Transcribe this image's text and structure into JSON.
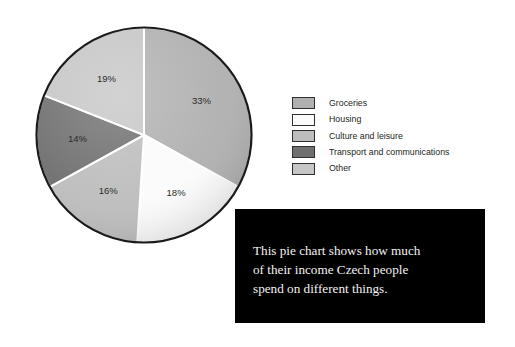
{
  "chart_data": {
    "type": "pie",
    "title": "",
    "categories": [
      "Groceries",
      "Housing",
      "Culture and leisure",
      "Transport and communications",
      "Other"
    ],
    "values": [
      33,
      18,
      16,
      14,
      19
    ],
    "value_labels": [
      "33%",
      "18%",
      "16%",
      "14%",
      "19%"
    ],
    "unit": "%",
    "colors": [
      "#b0b0b0",
      "#fbfbfb",
      "#bdbdbd",
      "#6f6f6f",
      "#c6c6c6"
    ],
    "start_angle_deg": 0,
    "direction": "clockwise",
    "legend_position": "right",
    "grid": false,
    "slices": [
      {
        "label": "Groceries",
        "value": 33,
        "value_label": "33%",
        "color": "#b0b0b0"
      },
      {
        "label": "Housing",
        "value": 18,
        "value_label": "18%",
        "color": "#fbfbfb"
      },
      {
        "label": "Culture and leisure",
        "value": 16,
        "value_label": "16%",
        "color": "#bdbdbd"
      },
      {
        "label": "Transport and communications",
        "value": 14,
        "value_label": "14%",
        "color": "#6f6f6f"
      },
      {
        "label": "Other",
        "value": 19,
        "value_label": "19%",
        "color": "#c6c6c6"
      }
    ]
  },
  "legend": {
    "items": [
      {
        "label": "Groceries",
        "color": "#b0b0b0"
      },
      {
        "label": "Housing",
        "color": "#fbfbfb"
      },
      {
        "label": "Culture and leisure",
        "color": "#bdbdbd"
      },
      {
        "label": "Transport and communications",
        "color": "#6f6f6f"
      },
      {
        "label": "Other",
        "color": "#c6c6c6"
      }
    ]
  },
  "caption": {
    "text": "This pie chart shows how much\nof their income Czech people\nspend on different things.",
    "background_color": "#000000",
    "text_color": "#f2f2f2"
  }
}
